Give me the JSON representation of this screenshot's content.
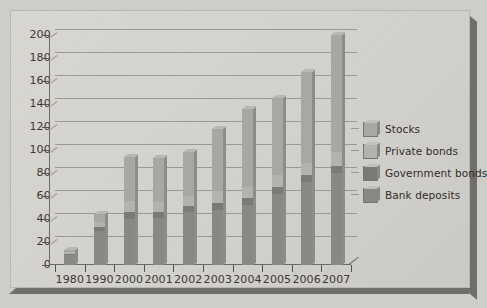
{
  "chart_data": {
    "type": "bar",
    "subtype": "stacked-bar",
    "title": "",
    "xlabel": "",
    "ylabel": "",
    "categories": [
      "1980",
      "1990",
      "2000",
      "2001",
      "2002",
      "2003",
      "2004",
      "2005",
      "2006",
      "2007"
    ],
    "series": [
      {
        "name": "Bank deposits",
        "color": "#8a8883",
        "values": [
          9,
          30,
          40,
          41,
          46,
          48,
          52,
          62,
          72,
          80
        ]
      },
      {
        "name": "Government bonds",
        "color": "#7c7a75",
        "values": [
          1,
          3,
          6,
          5,
          5,
          6,
          6,
          6,
          6,
          6
        ]
      },
      {
        "name": "Private bonds",
        "color": "#b4b2ad",
        "values": [
          1,
          4,
          10,
          9,
          9,
          10,
          10,
          10,
          11,
          12
        ]
      },
      {
        "name": "Stocks",
        "color": "#a9a7a2",
        "values": [
          2,
          7,
          38,
          38,
          38,
          54,
          68,
          67,
          79,
          102
        ]
      }
    ],
    "totals": [
      13,
      44,
      94,
      93,
      98,
      118,
      136,
      145,
      168,
      200
    ],
    "ylim": [
      0,
      200
    ],
    "ytick_step": 20,
    "yticks": [
      "0",
      "20",
      "40",
      "60",
      "80",
      "100",
      "120",
      "140",
      "160",
      "180",
      "200"
    ],
    "grid": true,
    "legend_position": "right"
  },
  "legend": {
    "items": [
      {
        "label": "Stocks"
      },
      {
        "label": "Private bonds"
      },
      {
        "label": "Government bonds"
      },
      {
        "label": "Bank deposits"
      }
    ]
  }
}
